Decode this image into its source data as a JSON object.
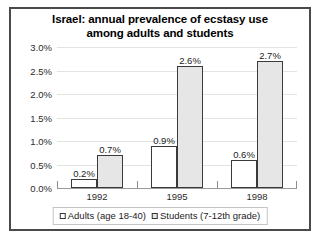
{
  "chart_data": {
    "type": "bar",
    "title": "Israel: annual prevalence of ecstasy use among adults and students",
    "title_lines": [
      "Israel: annual prevalence of ecstasy use",
      "among adults and students"
    ],
    "xlabel": "",
    "ylabel": "",
    "categories": [
      "1992",
      "1995",
      "1998"
    ],
    "series": [
      {
        "name": "Adults (age 18-40)",
        "values": [
          0.2,
          0.9,
          0.6
        ],
        "labels": [
          "0.2%",
          "0.9%",
          "0.6%"
        ],
        "color": "#ffffff"
      },
      {
        "name": "Students (7-12th grade)",
        "values": [
          0.7,
          2.6,
          2.7
        ],
        "labels": [
          "0.7%",
          "2.6%",
          "2.7%"
        ],
        "color": "#e6e6e6"
      }
    ],
    "ylim": [
      0,
      3.0
    ],
    "ytick_values": [
      0.0,
      0.5,
      1.0,
      1.5,
      2.0,
      2.5,
      3.0
    ],
    "ytick_labels": [
      "0.0%",
      "0.5%",
      "1.0%",
      "1.5%",
      "2.0%",
      "2.5%",
      "3.0%"
    ],
    "grid": true,
    "legend_position": "bottom"
  },
  "legend": {
    "entries": [
      {
        "label": "Adults (age 18-40)"
      },
      {
        "label": "Students (7-12th grade)"
      }
    ]
  },
  "colors": {
    "frame_border": "#4a4a4a",
    "bar_outline": "#3a3a3a",
    "gridline": "#e3e3e3",
    "axis": "#9a9a9a",
    "text": "#1c1c1c",
    "background": "#ffffff"
  }
}
